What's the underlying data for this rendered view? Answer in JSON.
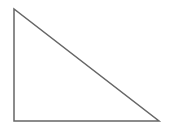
{
  "diagram": {
    "shape": "right-triangle",
    "stroke_color": "#666666",
    "fill_color": "#ffffff",
    "stroke_width": 1.5,
    "vertices": {
      "top": [
        14,
        9
      ],
      "bottom_left": [
        14,
        121
      ],
      "bottom_right": [
        159,
        121
      ]
    }
  }
}
